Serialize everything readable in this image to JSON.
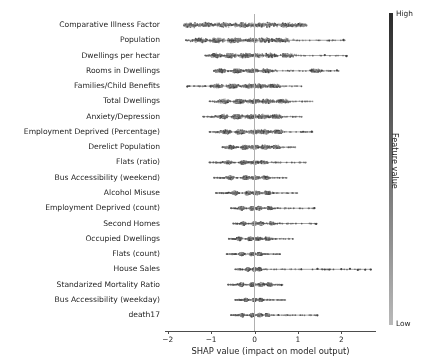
{
  "chart_data": {
    "type": "scatter",
    "title": "",
    "subtitle": "",
    "xlabel": "SHAP value (impact on model output)",
    "ylabel": "",
    "xlim": [
      -2.35,
      2.5
    ],
    "xticks": [
      -2,
      -1,
      0,
      1,
      2
    ],
    "xtick_labels": [
      "−2",
      "−1",
      "0",
      "1",
      "2"
    ],
    "grid": false,
    "zero_line": 0,
    "legend": {
      "position": "right",
      "type": "colorbar",
      "title": "Feature value",
      "high_label": "High",
      "low_label": "Low",
      "colormap": "grayscale",
      "high_color": "#2b2b2b",
      "low_color": "#b9b9b9"
    },
    "marker_color": "#404040",
    "categories": [
      "Comparative Illness Factor",
      "Population",
      "Dwellings per hectar",
      "Rooms in Dwellings",
      "Families/Child Benefits",
      "Total Dwellings",
      "Anxiety/Depression",
      "Employment Deprived (Percentage)",
      "Derelict Population",
      "Flats (ratio)",
      "Bus Accessibility (weekend)",
      "Alcohol Misuse",
      "Employment Deprived (count)",
      "Second Homes",
      "Occupied Dwellings",
      "Flats (count)",
      "House Sales",
      "Standarized Mortality Ratio",
      "Bus Accessibility (weekday)",
      "death17"
    ],
    "series": [
      {
        "name": "Comparative Illness Factor",
        "min": -1.62,
        "max": 1.2,
        "spread": 0.72,
        "lobes": [
          -1.45,
          -1.1,
          -0.72,
          -0.3,
          0.02,
          0.34,
          0.72,
          1.02
        ],
        "density_scale": 1.0
      },
      {
        "name": "Population",
        "min": -1.6,
        "max": 2.1,
        "spread": 0.62,
        "lobes": [
          -1.25,
          -0.85,
          -0.45,
          -0.05,
          0.3,
          0.62
        ],
        "density_scale": 0.95
      },
      {
        "name": "Dwellings per hectar",
        "min": -1.15,
        "max": 2.15,
        "spread": 0.5,
        "lobes": [
          -0.9,
          -0.55,
          -0.2,
          0.05,
          0.38,
          0.75
        ],
        "density_scale": 0.9
      },
      {
        "name": "Rooms in Dwellings",
        "min": -0.95,
        "max": 1.95,
        "spread": 0.42,
        "lobes": [
          -0.78,
          -0.4,
          -0.05,
          0.3,
          1.4
        ],
        "density_scale": 0.78
      },
      {
        "name": "Families/Child Benefits",
        "min": -1.55,
        "max": 1.1,
        "spread": 0.46,
        "lobes": [
          -0.85,
          -0.5,
          -0.12,
          0.12,
          0.45
        ],
        "density_scale": 0.82
      },
      {
        "name": "Total Dwellings",
        "min": -1.05,
        "max": 1.35,
        "spread": 0.44,
        "lobes": [
          -0.7,
          -0.35,
          -0.02,
          0.3,
          0.65
        ],
        "density_scale": 0.85
      },
      {
        "name": "Anxiety/Depression",
        "min": -1.2,
        "max": 1.1,
        "spread": 0.42,
        "lobes": [
          -0.72,
          -0.4,
          -0.08,
          0.2,
          0.5
        ],
        "density_scale": 0.88
      },
      {
        "name": "Employment Deprived (Percentage)",
        "min": -1.05,
        "max": 1.35,
        "spread": 0.4,
        "lobes": [
          -0.65,
          -0.32,
          0.0,
          0.25,
          0.55
        ],
        "density_scale": 0.86
      },
      {
        "name": "Derelict Population",
        "min": -0.75,
        "max": 0.95,
        "spread": 0.3,
        "lobes": [
          -0.55,
          -0.22,
          0.0,
          0.25,
          0.5
        ],
        "density_scale": 0.8
      },
      {
        "name": "Flats (ratio)",
        "min": -1.05,
        "max": 1.2,
        "spread": 0.3,
        "lobes": [
          -0.6,
          -0.25,
          0.0,
          0.22
        ],
        "density_scale": 0.62
      },
      {
        "name": "Bus Accessibility (weekend)",
        "min": -0.95,
        "max": 0.75,
        "spread": 0.26,
        "lobes": [
          -0.55,
          -0.2,
          0.02,
          0.25
        ],
        "density_scale": 0.72
      },
      {
        "name": "Alcohol Misuse",
        "min": -0.9,
        "max": 1.0,
        "spread": 0.24,
        "lobes": [
          -0.45,
          -0.15,
          0.05,
          0.3
        ],
        "density_scale": 0.75
      },
      {
        "name": "Employment Deprived (count)",
        "min": -0.55,
        "max": 1.4,
        "spread": 0.2,
        "lobes": [
          -0.3,
          -0.05,
          0.1,
          0.35
        ],
        "density_scale": 0.7
      },
      {
        "name": "Second Homes",
        "min": -0.5,
        "max": 1.45,
        "spread": 0.18,
        "lobes": [
          -0.25,
          0.0,
          0.15,
          0.4
        ],
        "density_scale": 0.62
      },
      {
        "name": "Occupied Dwellings",
        "min": -0.6,
        "max": 0.9,
        "spread": 0.2,
        "lobes": [
          -0.35,
          -0.1,
          0.08,
          0.3
        ],
        "density_scale": 0.68
      },
      {
        "name": "Flats (count)",
        "min": -0.65,
        "max": 0.6,
        "spread": 0.18,
        "lobes": [
          -0.3,
          -0.05,
          0.12
        ],
        "density_scale": 0.6
      },
      {
        "name": "House Sales",
        "min": -0.45,
        "max": 2.7,
        "spread": 0.14,
        "lobes": [
          -0.15,
          0.0,
          0.12
        ],
        "density_scale": 0.62
      },
      {
        "name": "Standarized Mortality Ratio",
        "min": -0.62,
        "max": 0.65,
        "spread": 0.2,
        "lobes": [
          -0.3,
          -0.05,
          0.15,
          0.35
        ],
        "density_scale": 0.72
      },
      {
        "name": "Bus Accessibility (weekday)",
        "min": -0.45,
        "max": 0.72,
        "spread": 0.14,
        "lobes": [
          -0.2,
          0.0,
          0.15
        ],
        "density_scale": 0.58
      },
      {
        "name": "death17",
        "min": -0.55,
        "max": 1.45,
        "spread": 0.16,
        "lobes": [
          -0.28,
          -0.05,
          0.12,
          0.3
        ],
        "density_scale": 0.66
      }
    ],
    "outliers": [
      {
        "row": 1,
        "x": 2.05
      },
      {
        "row": 1,
        "x": 1.72
      },
      {
        "row": 2,
        "x": 2.12
      },
      {
        "row": 2,
        "x": 1.62
      },
      {
        "row": 3,
        "x": 1.9
      },
      {
        "row": 3,
        "x": 1.55
      },
      {
        "row": 3,
        "x": 1.3
      },
      {
        "row": 4,
        "x": -1.55
      },
      {
        "row": 7,
        "x": 1.32
      },
      {
        "row": 7,
        "x": 1.12
      },
      {
        "row": 12,
        "x": 1.38
      },
      {
        "row": 13,
        "x": 1.42
      },
      {
        "row": 16,
        "x": 1.45
      },
      {
        "row": 16,
        "x": 1.62
      },
      {
        "row": 16,
        "x": 1.72
      },
      {
        "row": 16,
        "x": 2.0
      },
      {
        "row": 16,
        "x": 2.2
      },
      {
        "row": 16,
        "x": 2.38
      },
      {
        "row": 16,
        "x": 2.55
      },
      {
        "row": 16,
        "x": 2.68
      },
      {
        "row": 17,
        "x": 0.62
      },
      {
        "row": 19,
        "x": 1.45
      }
    ]
  },
  "axes": {
    "x_title": "SHAP value (impact on model output)",
    "x_tick_labels": [
      "−2",
      "−1",
      "0",
      "1",
      "2"
    ]
  },
  "colorbar": {
    "title": "Feature value",
    "high": "High",
    "low": "Low"
  }
}
